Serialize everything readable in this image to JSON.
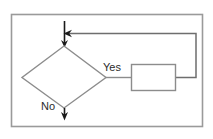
{
  "diagram": {
    "type": "flowchart-fragment",
    "frame": {
      "name": "outer-border",
      "x": 11,
      "y": 14,
      "width": 192,
      "height": 113,
      "stroke": "#9a9a9a",
      "fill": "#ffffff"
    },
    "nodes": {
      "decision": {
        "name": "decision-diamond",
        "label": "",
        "cx": 64,
        "cy": 77,
        "half_width": 42,
        "half_height": 31,
        "stroke": "#8c8c8c",
        "fill": "#ffffff"
      },
      "process": {
        "name": "process-box",
        "label": "",
        "x": 131,
        "y": 64,
        "width": 45,
        "height": 27,
        "stroke": "#8c8c8c",
        "fill": "#ffffff"
      }
    },
    "edges": [
      {
        "name": "entry-arrow",
        "label": "",
        "from": "top-entry",
        "to": "decision",
        "stroke": "#1a1a1a"
      },
      {
        "name": "yes-branch",
        "label": "Yes",
        "from": "decision",
        "to": "process",
        "stroke": "#8c8c8c",
        "label_x": 103,
        "label_y": 71
      },
      {
        "name": "no-branch",
        "label": "No",
        "from": "decision",
        "to": "exit-down",
        "stroke": "#1a1a1a",
        "label_x": 41,
        "label_y": 110
      },
      {
        "name": "feedback-loop",
        "label": "",
        "from": "process",
        "to": "entry-junction",
        "stroke": "#6e6e6e"
      }
    ],
    "colors": {
      "border": "#9a9a9a",
      "shape_stroke": "#8c8c8c",
      "arrow_dark": "#1a1a1a",
      "loop_stroke": "#6e6e6e",
      "text": "#2b2b2b",
      "background": "#ffffff"
    }
  }
}
